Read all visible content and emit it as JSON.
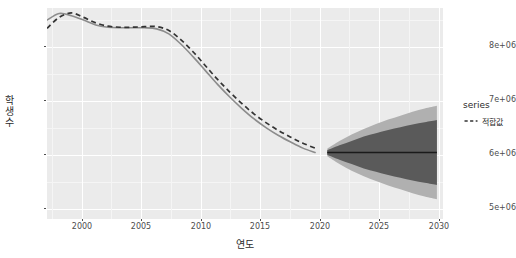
{
  "chart": {
    "title": "",
    "xlabel": "연도",
    "ylabel": "학생수",
    "legend_title": "series",
    "legend_items": [
      {
        "label": "적합값",
        "style": "dashed",
        "color": "#333333"
      }
    ],
    "y_ticks": [
      "5e+06",
      "6e+06",
      "7e+06",
      "8e+06"
    ],
    "x_ticks": [
      "2000",
      "2005",
      "2010",
      "2015",
      "2020",
      "2025",
      "2030"
    ],
    "panel_bg": "#ebebeb",
    "grid_color": "#ffffff",
    "observed_color": "#8c8c8c",
    "fitted_color": "#333333",
    "band_80_color": "#5a5a5a",
    "band_95_color": "#b0b0b0",
    "forecast_line_color": "#1a1a1a"
  },
  "chart_data": {
    "type": "line",
    "title": "",
    "xlabel": "연도",
    "ylabel": "학생수",
    "xlim": [
      1998,
      2030.5
    ],
    "ylim": [
      4780000,
      8620000
    ],
    "grid": true,
    "legend_position": "right",
    "legend_title": "series",
    "series": [
      {
        "name": "관측값",
        "style": "solid",
        "color": "#8c8c8c",
        "x": [
          1998,
          1999,
          2000,
          2001,
          2002,
          2003,
          2004,
          2005,
          2006,
          2007,
          2008,
          2009,
          2010,
          2011,
          2012,
          2013,
          2014,
          2015,
          2016,
          2017,
          2018,
          2019,
          2020
        ],
        "values": [
          8400000,
          8520000,
          8480000,
          8400000,
          8310000,
          8270000,
          8260000,
          8260000,
          8260000,
          8240000,
          8150000,
          7960000,
          7730000,
          7480000,
          7230000,
          7000000,
          6790000,
          6600000,
          6440000,
          6300000,
          6180000,
          6070000,
          5990000
        ]
      },
      {
        "name": "적합값",
        "style": "dashed",
        "color": "#333333",
        "x": [
          1998,
          1999,
          2000,
          2001,
          2002,
          2003,
          2004,
          2005,
          2006,
          2007,
          2008,
          2009,
          2010,
          2011,
          2012,
          2013,
          2014,
          2015,
          2016,
          2017,
          2018,
          2019,
          2020
        ],
        "values": [
          8250000,
          8450000,
          8530000,
          8450000,
          8350000,
          8290000,
          8270000,
          8270000,
          8280000,
          8280000,
          8210000,
          8040000,
          7820000,
          7570000,
          7320000,
          7090000,
          6880000,
          6690000,
          6530000,
          6390000,
          6270000,
          6160000,
          6070000
        ]
      }
    ],
    "forecast": {
      "name": "예측값",
      "x": [
        2021,
        2022,
        2023,
        2024,
        2025,
        2026,
        2027,
        2028,
        2029,
        2030
      ],
      "mean": [
        5990000,
        5990000,
        5990000,
        5990000,
        5990000,
        5990000,
        5990000,
        5990000,
        5990000,
        5990000
      ],
      "band_80": {
        "label": "80% 신뢰구간",
        "color": "#5a5a5a",
        "lower": [
          5950000,
          5860000,
          5780000,
          5700000,
          5640000,
          5580000,
          5530000,
          5480000,
          5440000,
          5400000
        ],
        "upper": [
          6030000,
          6120000,
          6200000,
          6280000,
          6340000,
          6400000,
          6450000,
          6500000,
          6540000,
          6580000
        ]
      },
      "band_95": {
        "label": "95% 신뢰구간",
        "color": "#b0b0b0",
        "lower": [
          5920000,
          5780000,
          5660000,
          5560000,
          5470000,
          5390000,
          5320000,
          5250000,
          5190000,
          5140000
        ],
        "upper": [
          6060000,
          6200000,
          6320000,
          6420000,
          6510000,
          6590000,
          6660000,
          6730000,
          6790000,
          6840000
        ]
      }
    }
  }
}
